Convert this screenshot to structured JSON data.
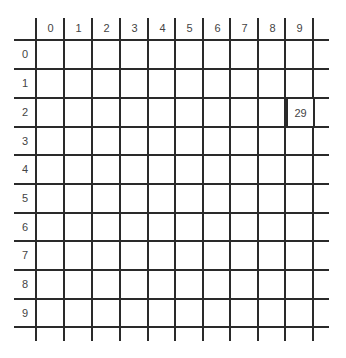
{
  "grid": {
    "columns": [
      "0",
      "1",
      "2",
      "3",
      "4",
      "5",
      "6",
      "7",
      "8",
      "9"
    ],
    "rows": [
      "0",
      "1",
      "2",
      "3",
      "4",
      "5",
      "6",
      "7",
      "8",
      "9"
    ],
    "highlighted_cell": {
      "row": 2,
      "col": 9,
      "value": "29"
    }
  }
}
